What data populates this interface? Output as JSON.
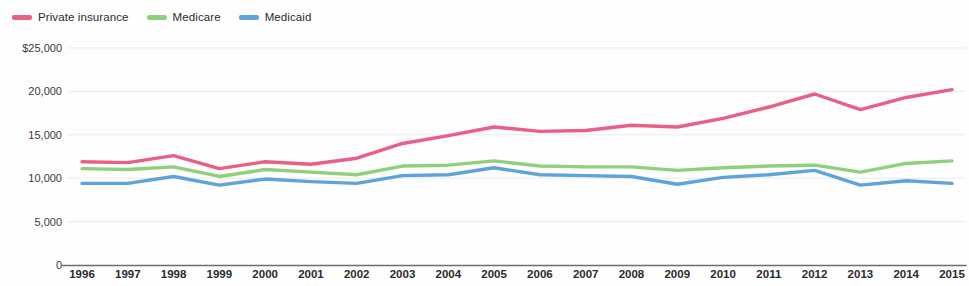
{
  "legend": {
    "position": "top-left",
    "items": [
      {
        "label": "Private insurance",
        "color": "#ea5f85",
        "key": "private_insurance"
      },
      {
        "label": "Medicare",
        "color": "#90d07c",
        "key": "medicare"
      },
      {
        "label": "Medicaid",
        "color": "#5fa3dc",
        "key": "medicaid"
      }
    ]
  },
  "axis": {
    "y_ticks": [
      "$25,000",
      "20,000",
      "15,000",
      "10,000",
      "5,000",
      "0"
    ],
    "y_tick_values": [
      25000,
      20000,
      15000,
      10000,
      5000,
      0
    ],
    "x_ticks": [
      "1996",
      "1997",
      "1998",
      "1999",
      "2000",
      "2001",
      "2002",
      "2003",
      "2004",
      "2005",
      "2006",
      "2007",
      "2008",
      "2009",
      "2010",
      "2011",
      "2012",
      "2013",
      "2014",
      "2015"
    ]
  },
  "colors": {
    "private_insurance": "#ea5f85",
    "medicare": "#90d07c",
    "medicaid": "#5fa3dc",
    "axis_line": "#6e6e6e",
    "gridline": "#ebebeb",
    "background": "#fefefe",
    "text": "#2b2b2b"
  },
  "chart_data": {
    "type": "line",
    "title": "",
    "subtitle": "",
    "xlabel": "",
    "ylabel": "",
    "xlim": [
      1996,
      2015
    ],
    "ylim": [
      0,
      25000
    ],
    "grid": true,
    "legend_position": "top-left",
    "x": [
      1996,
      1997,
      1998,
      1999,
      2000,
      2001,
      2002,
      2003,
      2004,
      2005,
      2006,
      2007,
      2008,
      2009,
      2010,
      2011,
      2012,
      2013,
      2014,
      2015
    ],
    "categories": [
      "1996",
      "1997",
      "1998",
      "1999",
      "2000",
      "2001",
      "2002",
      "2003",
      "2004",
      "2005",
      "2006",
      "2007",
      "2008",
      "2009",
      "2010",
      "2011",
      "2012",
      "2013",
      "2014",
      "2015"
    ],
    "series": [
      {
        "name": "Private insurance",
        "color": "#ea5f85",
        "values": [
          11900,
          11800,
          12600,
          11100,
          11900,
          11600,
          12300,
          14000,
          14900,
          15900,
          15400,
          15500,
          16100,
          15900,
          16900,
          18200,
          19700,
          17900,
          19300,
          20200
        ]
      },
      {
        "name": "Medicare",
        "color": "#90d07c",
        "values": [
          11100,
          11000,
          11300,
          10200,
          11000,
          10700,
          10400,
          11400,
          11500,
          12000,
          11400,
          11300,
          11300,
          10900,
          11200,
          11400,
          11500,
          10700,
          11700,
          12000
        ]
      },
      {
        "name": "Medicaid",
        "color": "#5fa3dc",
        "values": [
          9400,
          9400,
          10200,
          9200,
          9900,
          9600,
          9400,
          10300,
          10400,
          11200,
          10400,
          10300,
          10200,
          9300,
          10100,
          10400,
          10900,
          9200,
          9700,
          9400
        ]
      }
    ]
  }
}
